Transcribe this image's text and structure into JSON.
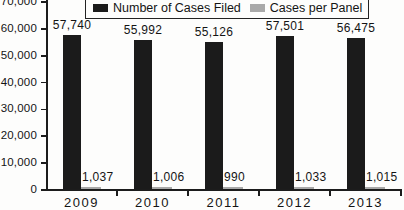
{
  "chart_data": {
    "type": "bar",
    "title": "",
    "xlabel": "",
    "ylabel": "",
    "categories": [
      "2009",
      "2010",
      "2011",
      "2012",
      "2013"
    ],
    "series": [
      {
        "name": "Number of Cases Filed",
        "color": "#1b1b1b",
        "values": [
          57740,
          55992,
          55126,
          57501,
          56475
        ],
        "value_labels": [
          "57,740",
          "55,992",
          "55,126",
          "57,501",
          "56,475"
        ]
      },
      {
        "name": "Cases per Panel",
        "color": "#a9a9a9",
        "values": [
          1037,
          1006,
          990,
          1033,
          1015
        ],
        "value_labels": [
          "1,037",
          "1,006",
          "990",
          "1,033",
          "1,015"
        ]
      }
    ],
    "ylim": [
      0,
      70000
    ],
    "y_ticks": [
      {
        "value": 70000,
        "label": "70,000"
      },
      {
        "value": 60000,
        "label": "60,000"
      },
      {
        "value": 50000,
        "label": "50,000"
      },
      {
        "value": 40000,
        "label": "40,000"
      },
      {
        "value": 30000,
        "label": "30,000"
      },
      {
        "value": 20000,
        "label": "20,000"
      },
      {
        "value": 10000,
        "label": "10,000"
      },
      {
        "value": 0,
        "label": "0"
      }
    ],
    "grid": false,
    "legend_position": "top"
  }
}
